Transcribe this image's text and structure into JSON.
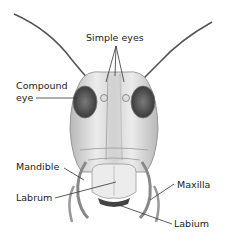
{
  "diagram": {
    "labels": {
      "simple_eyes": "Simple eyes",
      "compound_eye_line1": "Compound",
      "compound_eye_line2": "eye",
      "mandible": "Mandible",
      "labrum": "Labrum",
      "maxilla": "Maxilla",
      "labium": "Labium"
    },
    "colors": {
      "line": "#333333",
      "eye": "#4a4a4a",
      "head_fill": "#e6e6e6",
      "head_shade": "#bdbdbd"
    }
  }
}
